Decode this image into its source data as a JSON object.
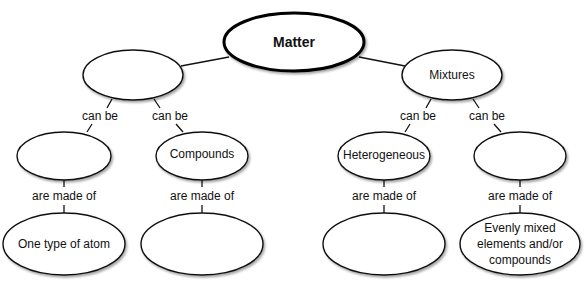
{
  "diagram": {
    "type": "concept-map",
    "root": {
      "id": "matter",
      "label": "Matter"
    },
    "nodes": [
      {
        "id": "left-l2",
        "label": ""
      },
      {
        "id": "mixtures",
        "label": "Mixtures"
      },
      {
        "id": "left-left-l3",
        "label": ""
      },
      {
        "id": "compounds",
        "label": "Compounds"
      },
      {
        "id": "heterogeneous",
        "label": "Heterogeneous"
      },
      {
        "id": "right-right-l3",
        "label": ""
      },
      {
        "id": "one-type-atom",
        "label": "One type of atom"
      },
      {
        "id": "compounds-made-of",
        "label": ""
      },
      {
        "id": "heterogeneous-made-of",
        "label": ""
      },
      {
        "id": "evenly-mixed",
        "lines": [
          "Evenly mixed",
          "elements and/or",
          "compounds"
        ]
      }
    ],
    "links": {
      "can_be": "can be",
      "are_made_of": "are made of"
    },
    "edges": [
      {
        "from": "matter",
        "to": "left-l2",
        "label": ""
      },
      {
        "from": "matter",
        "to": "mixtures",
        "label": ""
      },
      {
        "from": "left-l2",
        "to": "left-left-l3",
        "label": "can be"
      },
      {
        "from": "left-l2",
        "to": "compounds",
        "label": "can be"
      },
      {
        "from": "mixtures",
        "to": "heterogeneous",
        "label": "can be"
      },
      {
        "from": "mixtures",
        "to": "right-right-l3",
        "label": "can be"
      },
      {
        "from": "left-left-l3",
        "to": "one-type-atom",
        "label": "are made of"
      },
      {
        "from": "compounds",
        "to": "compounds-made-of",
        "label": "are made of"
      },
      {
        "from": "heterogeneous",
        "to": "heterogeneous-made-of",
        "label": "are made of"
      },
      {
        "from": "right-right-l3",
        "to": "evenly-mixed",
        "label": "are made of"
      }
    ]
  }
}
